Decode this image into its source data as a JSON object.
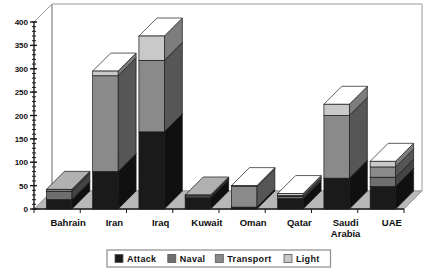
{
  "chart_data": {
    "type": "bar",
    "subtype": "stacked-3d-column",
    "title": "",
    "subtitle": "",
    "xlabel": "",
    "ylabel": "",
    "ylim": [
      0,
      400
    ],
    "yticks": [
      0,
      50,
      100,
      150,
      200,
      250,
      300,
      350,
      400
    ],
    "ytick_labels": [
      "0",
      "50",
      "100",
      "150",
      "200",
      "250",
      "300",
      "350",
      "400"
    ],
    "minor_tick_step": 10,
    "grid": false,
    "legend_position": "bottom",
    "categories": [
      "Bahrain",
      "Iran",
      "Iraq",
      "Kuwait",
      "Oman",
      "Qatar",
      "Saudi Arabia",
      "UAE"
    ],
    "category_labels_multiline": [
      [
        "Bahrain"
      ],
      [
        "Iran"
      ],
      [
        "Iraq"
      ],
      [
        "Kuwait"
      ],
      [
        "Oman"
      ],
      [
        "Qatar"
      ],
      [
        "Saudi",
        "Arabia"
      ],
      [
        "UAE"
      ]
    ],
    "series": [
      {
        "name": "Attack",
        "color": "#1a1a1a",
        "values": [
          20,
          80,
          165,
          24,
          4,
          22,
          66,
          48
        ]
      },
      {
        "name": "Naval",
        "color": "#6e6e6e",
        "values": [
          18,
          0,
          0,
          4,
          0,
          5,
          0,
          20
        ]
      },
      {
        "name": "Transport",
        "color": "#8a8a8a",
        "values": [
          4,
          205,
          153,
          2,
          44,
          2,
          134,
          22
        ]
      },
      {
        "name": "Light",
        "color": "#c9c9c9",
        "values": [
          0,
          10,
          52,
          0,
          2,
          4,
          24,
          12
        ]
      }
    ],
    "totals": [
      42,
      295,
      370,
      30,
      50,
      33,
      224,
      102
    ],
    "legend_entries": [
      {
        "label": "Attack",
        "color": "#1a1a1a"
      },
      {
        "label": "Naval",
        "color": "#6e6e6e"
      },
      {
        "label": "Transport",
        "color": "#8a8a8a"
      },
      {
        "label": "Light",
        "color": "#c9c9c9"
      }
    ]
  },
  "style": {
    "plot_background": "#ffffff",
    "floor_color": "#b8b8b8",
    "back_wall_color": "#ffffff",
    "frame_line": "#9a9a9a",
    "axis_line": "#1a1a1a",
    "legend_border": "#8c8c8c",
    "legend_background": "#ffffff",
    "bar_outline": "#1a1a1a"
  }
}
